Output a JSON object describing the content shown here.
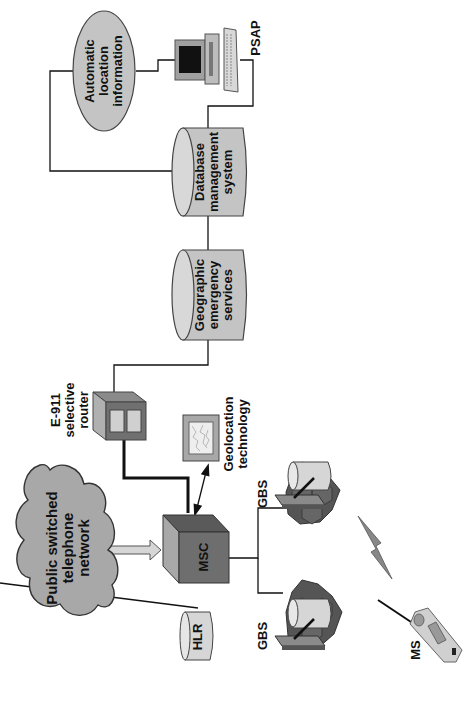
{
  "diagram": {
    "title": "",
    "orientation": "rotated-90-ccw",
    "colors": {
      "node_fill": "#c4c4c4",
      "dark_fill": "#6e6e6e",
      "cloud_fill": "#a8a8a8",
      "line": "#111111",
      "background": "#ffffff"
    },
    "nodes": {
      "ali": {
        "lines": [
          "Automatic",
          "location",
          "information"
        ]
      },
      "psap": {
        "label": "PSAP"
      },
      "dbms": {
        "lines": [
          "Database",
          "management",
          "system"
        ]
      },
      "ges": {
        "lines": [
          "Geographic",
          "emergency",
          "services"
        ]
      },
      "router": {
        "lines": [
          "E-911",
          "selective",
          "router"
        ]
      },
      "geo": {
        "lines": [
          "Geolocation",
          "technology"
        ]
      },
      "pstn": {
        "lines": [
          "Public switched",
          "telephone",
          "network"
        ]
      },
      "msc": {
        "label": "MSC"
      },
      "hlr": {
        "label": "HLR"
      },
      "gbs1": {
        "label": "GBS"
      },
      "gbs2": {
        "label": "GBS"
      },
      "ms": {
        "label": "MS"
      }
    },
    "edges": [
      [
        "Automatic location information",
        "Database management system"
      ],
      [
        "Automatic location information",
        "PSAP"
      ],
      [
        "PSAP",
        "Database management system"
      ],
      [
        "Database management system",
        "Geographic emergency services"
      ],
      [
        "Geographic emergency services",
        "E-911 selective router"
      ],
      [
        "E-911 selective router",
        "MSC"
      ],
      [
        "Geolocation technology",
        "MSC"
      ],
      [
        "Public switched telephone network",
        "MSC"
      ],
      [
        "MSC",
        "HLR"
      ],
      [
        "MSC",
        "GBS"
      ],
      [
        "MSC",
        "GBS"
      ],
      [
        "GBS",
        "MS"
      ]
    ]
  }
}
